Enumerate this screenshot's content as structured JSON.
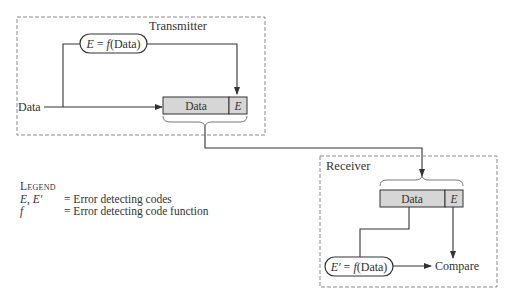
{
  "transmitter": {
    "title": "Transmitter",
    "input_label": "Data",
    "function_pill": {
      "lhs": "E",
      "eq": " = ",
      "fn": "f",
      "arg": "(Data)"
    },
    "frame": {
      "data_cell": "Data",
      "code_cell": "E"
    }
  },
  "receiver": {
    "title": "Receiver",
    "frame": {
      "data_cell": "Data",
      "code_cell": "E"
    },
    "function_pill": {
      "lhs": "E′",
      "eq": " = ",
      "fn": "f",
      "arg": "(Data)"
    },
    "compare_label": "Compare"
  },
  "legend": {
    "title": "Legend",
    "items": [
      {
        "symbol": "E, E′",
        "description": "= Error detecting codes"
      },
      {
        "symbol": "f",
        "description": "= Error detecting code function"
      }
    ]
  },
  "colors": {
    "cell_fill": "#d6d6d6",
    "line": "#333333",
    "dashed_border": "#8a8a8a"
  }
}
